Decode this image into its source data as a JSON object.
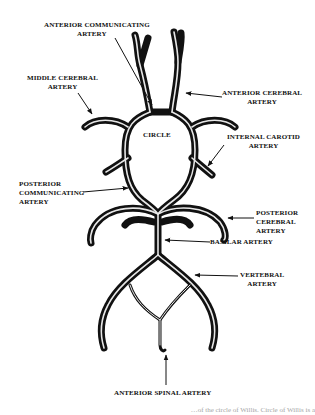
{
  "diagram": {
    "title": "Circle of Willis",
    "center_label": "CIRCLE",
    "labels": {
      "anterior_communicating": [
        "ANTERIOR COMMUNICATING",
        "ARTERY"
      ],
      "middle_cerebral": [
        "MIDDLE CEREBRAL",
        "ARTERY"
      ],
      "anterior_cerebral": [
        "ANTERIOR CEREBRAL",
        "ARTERY"
      ],
      "internal_carotid": [
        "INTERNAL CAROTID",
        "ARTERY"
      ],
      "posterior_communicating": [
        "POSTERIOR",
        "COMMUNICATING",
        "ARTERY"
      ],
      "posterior_cerebral": [
        "POSTERIOR",
        "CEREBRAL",
        "ARTERY"
      ],
      "basilar": [
        "BASILAR ARTERY"
      ],
      "vertebral": [
        "VERTEBRAL",
        "ARTERY"
      ],
      "anterior_spinal": [
        "ANTERIOR SPINAL ARTERY"
      ]
    },
    "caption_fragment": "…of the circle of Willis. Circle of Willis is a",
    "colors": {
      "vessel": "#111111",
      "background": "#ffffff",
      "text": "#111111"
    }
  }
}
